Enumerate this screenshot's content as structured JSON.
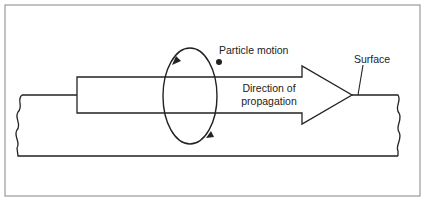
{
  "diagram": {
    "labels": {
      "particle_motion": "Particle motion",
      "direction_line1": "Direction of",
      "direction_line2": "propagation",
      "surface": "Surface"
    },
    "colors": {
      "frame": "#999999",
      "stroke": "#222222",
      "background": "#ffffff"
    },
    "elements": [
      {
        "type": "frame",
        "name": "outer-border"
      },
      {
        "type": "block",
        "name": "surface-block",
        "edges": "wavy left/right"
      },
      {
        "type": "arrow",
        "name": "propagation-arrow",
        "direction": "right"
      },
      {
        "type": "ellipse",
        "name": "particle-orbit",
        "rotation": "counterclockwise"
      },
      {
        "type": "dot",
        "name": "particle"
      }
    ]
  }
}
